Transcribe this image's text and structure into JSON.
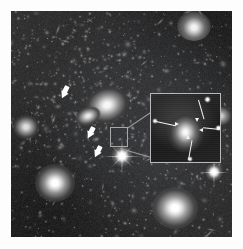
{
  "figure": {
    "kind": "astronomical-image",
    "caption": "",
    "border_color": "#ffffff",
    "plate": {
      "x": 11,
      "y": 11,
      "width": 221,
      "height": 226,
      "background": "#161616"
    }
  },
  "colors": {
    "background": "#ffffff",
    "sky": "#161616",
    "star": "#ffffff",
    "arrow_marker": "#fdfdfd",
    "inset_border": "#b9b9b9",
    "leader_line": "#9b9b9b",
    "source_box_border": "#a8a8a8"
  },
  "markers": {
    "label": "block-arrows",
    "count": 3,
    "items": [
      {
        "name": "arrow-1",
        "x": 62,
        "y": 86,
        "angle": 215,
        "length": 11,
        "thickness": 5
      },
      {
        "name": "arrow-2",
        "x": 88,
        "y": 127,
        "angle": 215,
        "length": 10,
        "thickness": 5
      },
      {
        "name": "arrow-3",
        "x": 95,
        "y": 146,
        "angle": 215,
        "length": 10,
        "thickness": 5
      }
    ]
  },
  "source_box": {
    "name": "magnified-region",
    "x": 110,
    "y": 127,
    "width": 18,
    "height": 20
  },
  "inset": {
    "name": "magnified-inset",
    "x": 150,
    "y": 93,
    "width": 71,
    "height": 70,
    "zoom_label": "",
    "central_object": "bright elliptical galaxy",
    "arrows": [
      {
        "name": "inset-arrow-top",
        "from_x": 57,
        "from_y": 5,
        "to_x": 46,
        "to_y": 26,
        "points": "down-left"
      },
      {
        "name": "inset-arrow-left",
        "from_x": 3,
        "from_y": 27,
        "to_x": 26,
        "to_y": 33,
        "points": "right"
      },
      {
        "name": "inset-arrow-right",
        "from_x": 69,
        "from_y": 35,
        "to_x": 50,
        "to_y": 38,
        "points": "left"
      },
      {
        "name": "inset-arrow-bottom",
        "from_x": 40,
        "from_y": 67,
        "to_x": 33,
        "to_y": 44,
        "points": "up-left"
      }
    ]
  },
  "leaders": [
    {
      "name": "leader-top",
      "x1": 127,
      "y1": 128,
      "x2": 150,
      "y2": 93
    },
    {
      "name": "leader-bottom",
      "x1": 120,
      "y1": 148,
      "x2": 150,
      "y2": 164
    }
  ],
  "sky_objects": {
    "description": "point sources and resolved galaxies across the field",
    "bright_galaxies": [
      {
        "name": "galaxy-bottom-left",
        "x": 44,
        "y": 183,
        "size": 17,
        "peak": "#ffffff"
      },
      {
        "name": "galaxy-bottom-right",
        "x": 170,
        "y": 206,
        "size": 19,
        "peak": "#ffffff"
      },
      {
        "name": "galaxy-center-bcg",
        "x": 98,
        "y": 102,
        "size": 16,
        "peak": "#f2f2f2"
      },
      {
        "name": "galaxy-upper-right",
        "x": 188,
        "y": 20,
        "size": 11,
        "peak": "#e8e8e8"
      },
      {
        "name": "galaxy-left-edge",
        "x": 17,
        "y": 118,
        "size": 9,
        "peak": "#dcdcdc"
      }
    ],
    "diffraction_stars": [
      {
        "name": "star-center-spikes",
        "x": 118,
        "y": 152,
        "span": 34
      },
      {
        "name": "star-right-spikes",
        "x": 213,
        "y": 172,
        "span": 28
      },
      {
        "name": "star-topright",
        "x": 191,
        "y": 72,
        "span": 16
      }
    ]
  }
}
